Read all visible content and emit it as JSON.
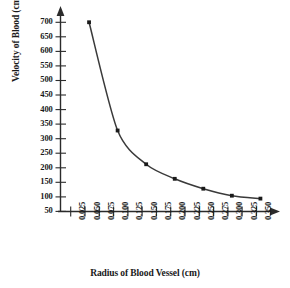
{
  "chart_data": {
    "type": "line",
    "title": "",
    "xlabel": "Radius of Blood Vessel (cm)",
    "ylabel": "Velocity of Blood (cm/sec)",
    "x": [
      0.05,
      0.1,
      0.15,
      0.2,
      0.25,
      0.3,
      0.35
    ],
    "values": [
      700,
      328,
      212,
      162,
      128,
      104,
      94
    ],
    "series": [
      {
        "name": "Velocity of Blood",
        "x": [
          0.05,
          0.1,
          0.15,
          0.2,
          0.25,
          0.3,
          0.35
        ],
        "values": [
          700,
          328,
          212,
          162,
          128,
          104,
          94
        ]
      }
    ],
    "xtick_labels": [
      "0.025",
      "0.050",
      "0.075",
      "0.100",
      "0.125",
      "0.150",
      "0.175",
      "0.200",
      "0.225",
      "0.250",
      "0.275",
      "0.300",
      "0.325",
      "0.350"
    ],
    "xtick_values": [
      0.025,
      0.05,
      0.075,
      0.1,
      0.125,
      0.15,
      0.175,
      0.2,
      0.225,
      0.25,
      0.275,
      0.3,
      0.325,
      0.35
    ],
    "ytick_labels": [
      "700",
      "650",
      "600",
      "550",
      "500",
      "450",
      "400",
      "350",
      "300",
      "250",
      "200",
      "150",
      "100",
      "50"
    ],
    "ytick_values": [
      700,
      650,
      600,
      550,
      500,
      450,
      400,
      350,
      300,
      250,
      200,
      150,
      100,
      50
    ],
    "xlim": [
      0,
      0.375
    ],
    "ylim": [
      0,
      740
    ],
    "grid": false,
    "legend": "none",
    "marker": "square",
    "line_color": "#3a3a3a",
    "marker_color": "#1a1a1a",
    "axis_color": "#2b2b2b",
    "background": "#ffffff",
    "axis_arrows": true
  }
}
